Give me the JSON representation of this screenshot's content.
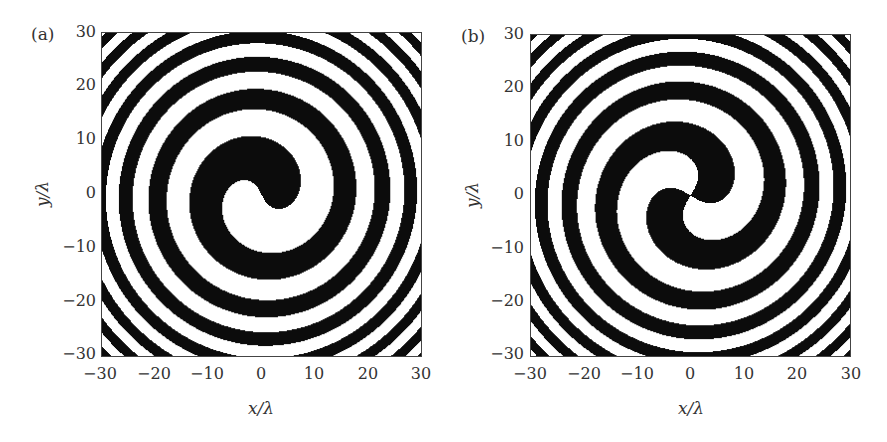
{
  "chart_data": [
    {
      "type": "heatmap",
      "panel_label": "(a)",
      "title": "",
      "description": "Binary single-arm spiral zone plate (topological charge m = 1)",
      "xlabel": "x/λ",
      "ylabel": "y/λ",
      "xlim": [
        -30,
        30
      ],
      "ylim": [
        -30,
        30
      ],
      "xticks": [
        "−30",
        "−20",
        "−10",
        "0",
        "10",
        "20",
        "30"
      ],
      "yticks": [
        "30",
        "20",
        "10",
        "0",
        "−10",
        "−20",
        "−30"
      ],
      "arms": 1,
      "colors": [
        "#000000",
        "#ffffff"
      ],
      "grid": false
    },
    {
      "type": "heatmap",
      "panel_label": "(b)",
      "title": "",
      "description": "Binary two-arm spiral zone plate (topological charge m = 2)",
      "xlabel": "x/λ",
      "ylabel": "y/λ",
      "xlim": [
        -30,
        30
      ],
      "ylim": [
        -30,
        30
      ],
      "xticks": [
        "−30",
        "−20",
        "−10",
        "0",
        "10",
        "20",
        "30"
      ],
      "yticks": [
        "30",
        "20",
        "10",
        "0",
        "−10",
        "−20",
        "−30"
      ],
      "arms": 2,
      "colors": [
        "#000000",
        "#ffffff"
      ],
      "grid": false
    }
  ]
}
